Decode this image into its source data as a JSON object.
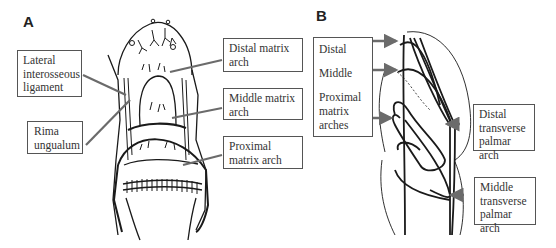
{
  "panels": {
    "a": {
      "label": "A",
      "callouts": {
        "lateral": {
          "lines": [
            "Lateral",
            "interosseous",
            "ligament"
          ]
        },
        "rima": {
          "lines": [
            "Rima",
            "ungualum"
          ]
        },
        "distal": {
          "lines": [
            "Distal matrix",
            "arch"
          ]
        },
        "middle": {
          "lines": [
            "Middle matrix",
            "arch"
          ]
        },
        "proximal": {
          "lines": [
            "Proximal",
            "matrix arch"
          ]
        }
      }
    },
    "b": {
      "label": "B",
      "callouts": {
        "matrix": {
          "lines": [
            "Distal",
            "Middle",
            "Proximal",
            "matrix",
            "arches"
          ]
        },
        "distal_palmar": {
          "lines": [
            "Distal",
            "transverse",
            "palmar arch"
          ]
        },
        "middle_palmar": {
          "lines": [
            "Middle",
            "transverse",
            "palmar arch"
          ]
        }
      }
    }
  },
  "colors": {
    "arrow": "#6b6b6b",
    "line": "#1a1a1a",
    "border": "#555555"
  }
}
